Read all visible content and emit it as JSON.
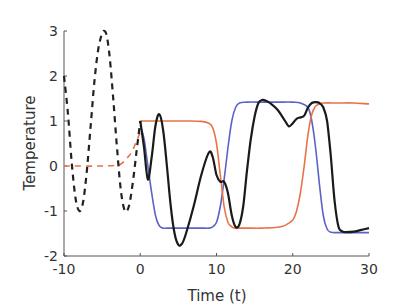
{
  "chart_data": {
    "type": "line",
    "title": "",
    "xlabel": "Time (t)",
    "ylabel": "Temperature",
    "xlim": [
      -10,
      30
    ],
    "ylim": [
      -2,
      3
    ],
    "xticks": [
      -10,
      0,
      10,
      20,
      30
    ],
    "yticks": [
      -2,
      -1,
      0,
      1,
      2,
      3
    ],
    "grid": false,
    "legend": null,
    "series": [
      {
        "name": "history (dashed black)",
        "color": "#222222",
        "style": "dashed",
        "x": [
          -10,
          -9.5,
          -9,
          -8.5,
          -8,
          -7.5,
          -7,
          -6.5,
          -6,
          -5.5,
          -5,
          -4.7,
          -4.4,
          -4,
          -3.5,
          -3,
          -2.5,
          -2,
          -1.5,
          -1,
          -0.5,
          0
        ],
        "y": [
          2.0,
          1.2,
          0.1,
          -0.7,
          -1.0,
          -0.8,
          -0.1,
          0.9,
          1.9,
          2.6,
          2.95,
          3.0,
          2.9,
          2.4,
          1.4,
          0.3,
          -0.6,
          -1.0,
          -0.9,
          -0.4,
          0.3,
          1.0
        ]
      },
      {
        "name": "history (dashed orange)",
        "color": "#e8734a",
        "style": "dashed",
        "x": [
          -10,
          -5,
          -3,
          -2.5,
          -2,
          -1.5,
          -1,
          -0.5,
          0
        ],
        "y": [
          0,
          0,
          0.02,
          0.05,
          0.12,
          0.22,
          0.35,
          0.55,
          0.75
        ]
      },
      {
        "name": "black solution",
        "color": "#1a1a1a",
        "style": "solid",
        "x": [
          0,
          0.5,
          1,
          1.5,
          2,
          2.5,
          3,
          3.5,
          4,
          4.5,
          5,
          5.5,
          6,
          7,
          8,
          9,
          9.5,
          10,
          10.5,
          11,
          11.5,
          12,
          12.5,
          13,
          13.5,
          14,
          14.5,
          15,
          15.5,
          16,
          16.5,
          17,
          18,
          19,
          19.5,
          20,
          20.5,
          21,
          21.5,
          22,
          22.5,
          23,
          23.5,
          24,
          24.5,
          25,
          25.5,
          26,
          26.5,
          27,
          28,
          29,
          30
        ],
        "y": [
          1.0,
          0.4,
          -0.3,
          0.2,
          0.9,
          1.15,
          0.8,
          0.0,
          -0.9,
          -1.5,
          -1.75,
          -1.72,
          -1.5,
          -0.9,
          -0.2,
          0.3,
          0.2,
          -0.2,
          -0.35,
          -0.35,
          -0.6,
          -1.1,
          -1.35,
          -1.3,
          -0.9,
          -0.1,
          0.6,
          1.1,
          1.4,
          1.47,
          1.45,
          1.4,
          1.25,
          1.0,
          0.88,
          0.95,
          1.05,
          1.08,
          1.12,
          1.3,
          1.4,
          1.42,
          1.4,
          1.3,
          1.0,
          0.2,
          -0.8,
          -1.35,
          -1.45,
          -1.47,
          -1.46,
          -1.42,
          -1.38
        ]
      },
      {
        "name": "blue solution",
        "color": "#5b63c6",
        "style": "solid",
        "x": [
          0,
          0.5,
          1,
          1.5,
          2,
          2.5,
          3,
          3.5,
          4,
          6,
          8,
          9,
          9.5,
          10,
          10.5,
          11,
          11.5,
          12,
          12.5,
          13,
          14,
          16,
          18,
          20,
          21,
          22,
          22.5,
          23,
          23.5,
          24,
          24.5,
          25,
          26,
          28,
          30
        ],
        "y": [
          0.9,
          0.6,
          0.0,
          -0.6,
          -1.1,
          -1.33,
          -1.38,
          -1.38,
          -1.38,
          -1.38,
          -1.38,
          -1.38,
          -1.35,
          -1.25,
          -0.9,
          -0.3,
          0.4,
          1.0,
          1.3,
          1.4,
          1.42,
          1.42,
          1.42,
          1.42,
          1.4,
          1.3,
          1.0,
          0.4,
          -0.4,
          -1.1,
          -1.4,
          -1.47,
          -1.48,
          -1.48,
          -1.48
        ]
      },
      {
        "name": "orange solution",
        "color": "#e8734a",
        "style": "solid",
        "x": [
          0,
          2,
          4,
          6,
          8,
          9,
          9.5,
          10,
          10.5,
          11,
          11.5,
          12,
          12.5,
          13,
          14,
          16,
          18,
          19,
          20,
          20.5,
          21,
          21.5,
          22,
          22.5,
          23,
          23.5,
          24,
          26,
          28,
          30
        ],
        "y": [
          1.0,
          1.0,
          1.0,
          1.0,
          0.99,
          0.95,
          0.85,
          0.5,
          -0.2,
          -0.9,
          -1.25,
          -1.35,
          -1.38,
          -1.38,
          -1.38,
          -1.38,
          -1.36,
          -1.32,
          -1.2,
          -1.0,
          -0.6,
          0.0,
          0.7,
          1.15,
          1.33,
          1.38,
          1.4,
          1.4,
          1.4,
          1.38
        ]
      }
    ]
  }
}
